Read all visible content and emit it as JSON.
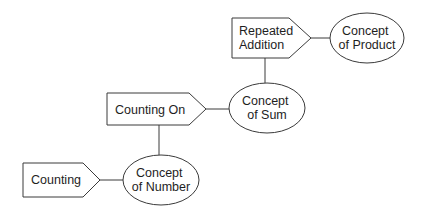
{
  "diagram": {
    "colors": {
      "background": "#ffffff",
      "stroke": "#3a3a3a",
      "text": "#1e1e1e"
    },
    "nodes": [
      {
        "id": "counting",
        "shape": "pentagon-arrow",
        "lines": [
          "Counting"
        ]
      },
      {
        "id": "concept_of_number",
        "shape": "ellipse",
        "lines": [
          "Concept",
          "of Number"
        ]
      },
      {
        "id": "counting_on",
        "shape": "pentagon-arrow",
        "lines": [
          "Counting On"
        ]
      },
      {
        "id": "concept_of_sum",
        "shape": "ellipse",
        "lines": [
          "Concept",
          "of Sum"
        ]
      },
      {
        "id": "repeated_addition",
        "shape": "pentagon-arrow",
        "lines": [
          "Repeated",
          "Addition"
        ]
      },
      {
        "id": "concept_of_product",
        "shape": "ellipse",
        "lines": [
          "Concept",
          "of Product"
        ]
      }
    ],
    "edges": [
      {
        "from": "counting",
        "to": "concept_of_number"
      },
      {
        "from": "concept_of_number",
        "to": "counting_on"
      },
      {
        "from": "counting_on",
        "to": "concept_of_sum"
      },
      {
        "from": "concept_of_sum",
        "to": "repeated_addition"
      },
      {
        "from": "repeated_addition",
        "to": "concept_of_product"
      }
    ]
  }
}
